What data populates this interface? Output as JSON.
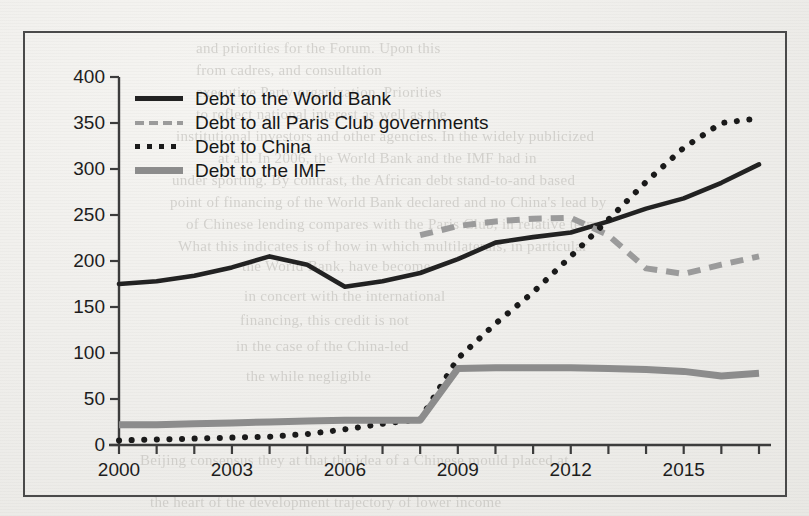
{
  "figure": {
    "frame": true,
    "background_note": "scanned book page, light gray paper"
  },
  "legend": {
    "position": "top-left inside plot",
    "entries": [
      {
        "label": "Debt to the World Bank",
        "style": "solid",
        "color": "#222222",
        "key": "world-bank"
      },
      {
        "label": "Debt to all Paris Club governments",
        "style": "dashed",
        "color": "#9b9b9b",
        "key": "paris-club"
      },
      {
        "label": "Debt to China",
        "style": "dotted",
        "color": "#1a1a1a",
        "key": "china"
      },
      {
        "label": "Debt to the IMF",
        "style": "thick-solid",
        "color": "#8c8c8c",
        "key": "imf"
      }
    ]
  },
  "axes": {
    "y_ticks": [
      "400",
      "350",
      "300",
      "250",
      "200",
      "150",
      "100",
      "50",
      "0"
    ],
    "x_ticks_labeled": [
      "2000",
      "2003",
      "2006",
      "2009",
      "2012",
      "2015"
    ],
    "x_tick_years_all": [
      2000,
      2001,
      2002,
      2003,
      2004,
      2005,
      2006,
      2007,
      2008,
      2009,
      2010,
      2011,
      2012,
      2013,
      2014,
      2015,
      2016,
      2017
    ]
  },
  "bleed_through_text": [
    {
      "text": "and priorities for the Forum. Upon this",
      "x": 196,
      "y": 40,
      "size": 15
    },
    {
      "text": "from cadres, and consultation",
      "x": 196,
      "y": 62,
      "size": 15
    },
    {
      "text": "executive Party organization. Priorities",
      "x": 196,
      "y": 84,
      "size": 15
    },
    {
      "text": "to reflect national interest as well as the",
      "x": 196,
      "y": 106,
      "size": 15
    },
    {
      "text": "institutional investors and other agencies. In the widely publicized",
      "x": 176,
      "y": 128,
      "size": 15
    },
    {
      "text": "at all. In 2006, the World Bank and the IMF had in",
      "x": 218,
      "y": 150,
      "size": 15
    },
    {
      "text": "under sporting. By contrast, the African debt stand-to-and based",
      "x": 172,
      "y": 172,
      "size": 15
    },
    {
      "text": "point of financing of the World Bank declared and no China's lead by",
      "x": 170,
      "y": 194,
      "size": 15
    },
    {
      "text": "of Chinese lending compares with the Paris Club, in relative terms",
      "x": 186,
      "y": 216,
      "size": 15
    },
    {
      "text": "What this indicates is of how in which multilaterals, in particular",
      "x": 178,
      "y": 238,
      "size": 15
    },
    {
      "text": "the World Bank, have become",
      "x": 242,
      "y": 258,
      "size": 15
    },
    {
      "text": "in concert with the international",
      "x": 244,
      "y": 288,
      "size": 15
    },
    {
      "text": "financing, this credit is not",
      "x": 240,
      "y": 312,
      "size": 15
    },
    {
      "text": "in the case of the China-led",
      "x": 236,
      "y": 338,
      "size": 15
    },
    {
      "text": "the while negligible",
      "x": 246,
      "y": 368,
      "size": 15
    },
    {
      "text": "Beijing consensus they at that the idea of a Chinese mould placed at",
      "x": 140,
      "y": 452,
      "size": 15
    },
    {
      "text": "the heart of the development trajectory of lower income",
      "x": 150,
      "y": 494,
      "size": 15
    }
  ],
  "chart_data": {
    "type": "line",
    "title": "",
    "xlabel": "",
    "ylabel": "",
    "xlim": [
      2000,
      2017
    ],
    "ylim": [
      0,
      400
    ],
    "grid": false,
    "x": [
      2000,
      2001,
      2002,
      2003,
      2004,
      2005,
      2006,
      2007,
      2008,
      2009,
      2010,
      2011,
      2012,
      2013,
      2014,
      2015,
      2016,
      2017
    ],
    "series": [
      {
        "name": "Debt to the World Bank",
        "style": "solid",
        "color": "#222222",
        "values": [
          175,
          178,
          184,
          193,
          205,
          196,
          172,
          178,
          187,
          202,
          220,
          226,
          231,
          243,
          257,
          268,
          285,
          305
        ]
      },
      {
        "name": "Debt to all Paris Club governments",
        "style": "dashed",
        "color": "#9b9b9b",
        "start_year": 2008,
        "values": [
          null,
          null,
          null,
          null,
          null,
          null,
          null,
          null,
          228,
          238,
          243,
          246,
          247,
          228,
          192,
          186,
          196,
          205
        ]
      },
      {
        "name": "Debt to China",
        "style": "dotted",
        "color": "#1a1a1a",
        "values": [
          5,
          6,
          7,
          8,
          9,
          12,
          17,
          23,
          28,
          94,
          132,
          166,
          205,
          245,
          286,
          323,
          350,
          355
        ]
      },
      {
        "name": "Debt to the IMF",
        "style": "thick-solid",
        "color": "#8c8c8c",
        "values": [
          22,
          22,
          23,
          24,
          25,
          26,
          27,
          27,
          27,
          83,
          84,
          84,
          84,
          83,
          82,
          80,
          75,
          78
        ]
      }
    ]
  }
}
